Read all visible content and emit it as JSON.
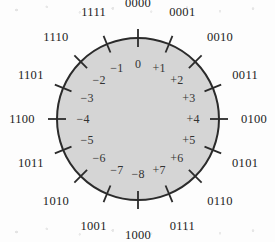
{
  "figure": {
    "kind": "number-circle",
    "bits": 4,
    "fill_color": "#d5d5d5",
    "stroke_color": "#2b2b2b",
    "background_color": "#fdfdfd",
    "center_x": 138,
    "center_y": 119,
    "radius": 81,
    "tick_inner_offset": 9,
    "tick_outer_offset": 9,
    "outer_label_offset": 26,
    "inner_label_offset": 17
  },
  "chart_data": {
    "type": "pie",
    "title": "",
    "categories": [
      "0000",
      "0001",
      "0010",
      "0011",
      "0100",
      "0101",
      "0110",
      "0111",
      "1000",
      "1001",
      "1010",
      "1011",
      "1100",
      "1101",
      "1110",
      "1111"
    ],
    "values": [
      1,
      1,
      1,
      1,
      1,
      1,
      1,
      1,
      1,
      1,
      1,
      1,
      1,
      1,
      1,
      1
    ],
    "legend_position": "none",
    "grid": false,
    "points": [
      {
        "index": 0,
        "binary": "0000",
        "decimal": "0",
        "angle_deg": 0
      },
      {
        "index": 1,
        "binary": "0001",
        "decimal": "+1",
        "angle_deg": 22.5
      },
      {
        "index": 2,
        "binary": "0010",
        "decimal": "+2",
        "angle_deg": 45
      },
      {
        "index": 3,
        "binary": "0011",
        "decimal": "+3",
        "angle_deg": 67.5
      },
      {
        "index": 4,
        "binary": "0100",
        "decimal": "+4",
        "angle_deg": 90
      },
      {
        "index": 5,
        "binary": "0101",
        "decimal": "+5",
        "angle_deg": 112.5
      },
      {
        "index": 6,
        "binary": "0110",
        "decimal": "+6",
        "angle_deg": 135
      },
      {
        "index": 7,
        "binary": "0111",
        "decimal": "+7",
        "angle_deg": 157.5
      },
      {
        "index": 8,
        "binary": "1000",
        "decimal": "−8",
        "angle_deg": 180
      },
      {
        "index": 9,
        "binary": "1001",
        "decimal": "−7",
        "angle_deg": 202.5
      },
      {
        "index": 10,
        "binary": "1010",
        "decimal": "−6",
        "angle_deg": 225
      },
      {
        "index": 11,
        "binary": "1011",
        "decimal": "−5",
        "angle_deg": 247.5
      },
      {
        "index": 12,
        "binary": "1100",
        "decimal": "−4",
        "angle_deg": 270
      },
      {
        "index": 13,
        "binary": "1101",
        "decimal": "−3",
        "angle_deg": 292.5
      },
      {
        "index": 14,
        "binary": "1110",
        "decimal": "−2",
        "angle_deg": 315
      },
      {
        "index": 15,
        "binary": "1111",
        "decimal": "−1",
        "angle_deg": 337.5
      }
    ]
  }
}
